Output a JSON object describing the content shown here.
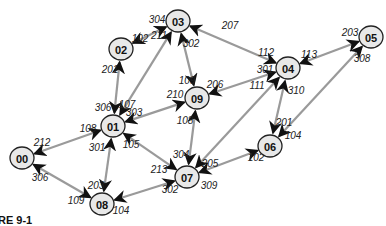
{
  "caption": "RE 9-1",
  "colors": {
    "edge": "#9a9a9a",
    "node_fill": "#e8e8e8",
    "node_stroke": "#222222",
    "text": "#111111"
  },
  "nodes": [
    {
      "id": "00",
      "x": 22,
      "y": 158
    },
    {
      "id": "01",
      "x": 113,
      "y": 126
    },
    {
      "id": "02",
      "x": 121,
      "y": 49
    },
    {
      "id": "03",
      "x": 178,
      "y": 21
    },
    {
      "id": "04",
      "x": 288,
      "y": 68
    },
    {
      "id": "05",
      "x": 371,
      "y": 37
    },
    {
      "id": "06",
      "x": 270,
      "y": 146
    },
    {
      "id": "07",
      "x": 187,
      "y": 177
    },
    {
      "id": "08",
      "x": 102,
      "y": 204
    },
    {
      "id": "09",
      "x": 197,
      "y": 98
    }
  ],
  "edges": [
    {
      "a": "00",
      "b": "01",
      "label_a": "212",
      "la": [
        42,
        142
      ],
      "label_b": "108",
      "lb": [
        88,
        128
      ]
    },
    {
      "a": "00",
      "b": "08",
      "label_a": "306",
      "la": [
        40,
        177
      ],
      "label_b": "109",
      "lb": [
        76,
        200
      ]
    },
    {
      "a": "01",
      "b": "02",
      "label_a": "306",
      "la": [
        103,
        107
      ],
      "label_b": "201",
      "lb": [
        110,
        69
      ]
    },
    {
      "a": "01",
      "b": "03",
      "label_a": "107",
      "la": [
        127,
        104
      ],
      "label_b": "211",
      "lb": [
        159,
        35
      ]
    },
    {
      "a": "01",
      "b": "09",
      "label_a": "303",
      "la": [
        134,
        112
      ],
      "label_b": "210",
      "lb": [
        175,
        94
      ]
    },
    {
      "a": "01",
      "b": "07",
      "label_a": "105",
      "la": [
        131,
        144
      ],
      "label_b": "213",
      "lb": [
        159,
        169
      ]
    },
    {
      "a": "01",
      "b": "08",
      "label_a": "301",
      "la": [
        97,
        147
      ],
      "label_b": "203",
      "lb": [
        96,
        185
      ]
    },
    {
      "a": "02",
      "b": "03",
      "label_a": "102",
      "la": [
        140,
        38
      ],
      "label_b": "304",
      "lb": [
        157,
        19
      ]
    },
    {
      "a": "03",
      "b": "09",
      "label_a": "302",
      "la": [
        191,
        43
      ],
      "label_b": "109",
      "lb": [
        187,
        80
      ]
    },
    {
      "a": "03",
      "b": "04",
      "label_a": "207",
      "la": [
        230,
        25
      ],
      "label_b": "112",
      "lb": [
        266,
        52
      ]
    },
    {
      "a": "04",
      "b": "05",
      "label_a": "113",
      "la": [
        309,
        54
      ],
      "label_b": "203",
      "lb": [
        350,
        32
      ]
    },
    {
      "a": "04",
      "b": "09",
      "label_a": "301",
      "la": [
        265,
        69
      ],
      "label_b": "206",
      "lb": [
        215,
        84
      ]
    },
    {
      "a": "04",
      "b": "07",
      "label_a": "111",
      "la": [
        257,
        85
      ],
      "label_b": "205",
      "lb": [
        210,
        163
      ]
    },
    {
      "a": "04",
      "b": "06",
      "label_a": "310",
      "la": [
        296,
        90
      ],
      "label_b": "201",
      "lb": [
        284,
        122
      ]
    },
    {
      "a": "05",
      "b": "06",
      "label_a": "308",
      "la": [
        362,
        58
      ],
      "label_b": "104",
      "lb": [
        293,
        135
      ]
    },
    {
      "a": "06",
      "b": "07",
      "label_a": "102",
      "la": [
        256,
        157
      ],
      "label_b": "309",
      "lb": [
        209,
        185
      ]
    },
    {
      "a": "07",
      "b": "09",
      "label_a": "304",
      "la": [
        181,
        154
      ],
      "label_b": "108",
      "lb": [
        185,
        120
      ]
    },
    {
      "a": "07",
      "b": "08",
      "label_a": "302",
      "la": [
        170,
        189
      ],
      "label_b": "104",
      "lb": [
        121,
        210
      ]
    }
  ]
}
